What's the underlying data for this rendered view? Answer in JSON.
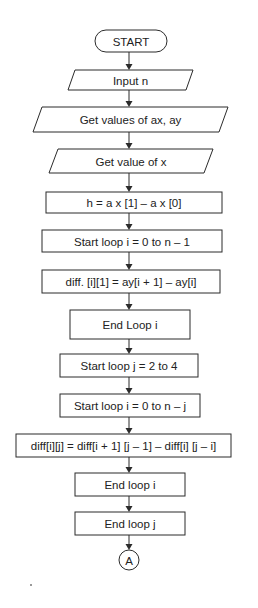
{
  "flowchart": {
    "colors": {
      "stroke": "#2b2b2b",
      "fill": "#ffffff",
      "text": "#222222"
    },
    "nodes": [
      {
        "id": "start",
        "type": "terminator",
        "label": "START",
        "x": 95,
        "y": 30,
        "w": 72,
        "h": 22
      },
      {
        "id": "input-n",
        "type": "io",
        "label": "Input n",
        "x": 68,
        "y": 70,
        "w": 125,
        "h": 20,
        "skew": 7
      },
      {
        "id": "get-ax-ay",
        "type": "io",
        "label": "Get values of ax, ay",
        "x": 33,
        "y": 107,
        "w": 195,
        "h": 25,
        "skew": 9
      },
      {
        "id": "get-x",
        "type": "io",
        "label": "Get value of x",
        "x": 49,
        "y": 149,
        "w": 164,
        "h": 24,
        "skew": 9
      },
      {
        "id": "calc-h",
        "type": "process",
        "label": "h = a x [1] – a x [0]",
        "x": 46,
        "y": 192,
        "w": 176,
        "h": 21
      },
      {
        "id": "loop-i-start-1",
        "type": "process",
        "label": "Start loop i = 0 to n – 1",
        "x": 42,
        "y": 230,
        "w": 180,
        "h": 22
      },
      {
        "id": "calc-diff-1",
        "type": "process",
        "label": "diff. [i][1] = ay[i + 1] – ay[i]",
        "x": 42,
        "y": 270,
        "w": 178,
        "h": 23
      },
      {
        "id": "loop-i-end-1",
        "type": "process",
        "label": "End Loop i",
        "x": 70,
        "y": 310,
        "w": 120,
        "h": 29
      },
      {
        "id": "loop-j-start",
        "type": "process",
        "label": "Start loop j = 2 to 4",
        "x": 60,
        "y": 354,
        "w": 138,
        "h": 23
      },
      {
        "id": "loop-i-start-2",
        "type": "process",
        "label": "Start loop i = 0 to n – j",
        "x": 60,
        "y": 394,
        "w": 140,
        "h": 23
      },
      {
        "id": "calc-diff-ij",
        "type": "process",
        "label": "diff[i][j] = diff[i + 1] [j – 1] – diff[i] [j – i]",
        "x": 16,
        "y": 434,
        "w": 215,
        "h": 23
      },
      {
        "id": "loop-i-end-2",
        "type": "process",
        "label": "End loop i",
        "x": 75,
        "y": 473,
        "w": 110,
        "h": 23
      },
      {
        "id": "loop-j-end",
        "type": "process",
        "label": "End loop j",
        "x": 75,
        "y": 512,
        "w": 110,
        "h": 23
      },
      {
        "id": "connector-a",
        "type": "connector",
        "label": "A",
        "cx": 129,
        "cy": 560,
        "r": 10
      }
    ],
    "edges": [
      {
        "from": "start",
        "to": "input-n"
      },
      {
        "from": "input-n",
        "to": "get-ax-ay"
      },
      {
        "from": "get-ax-ay",
        "to": "get-x"
      },
      {
        "from": "get-x",
        "to": "calc-h"
      },
      {
        "from": "calc-h",
        "to": "loop-i-start-1"
      },
      {
        "from": "loop-i-start-1",
        "to": "calc-diff-1"
      },
      {
        "from": "calc-diff-1",
        "to": "loop-i-end-1"
      },
      {
        "from": "loop-i-end-1",
        "to": "loop-j-start"
      },
      {
        "from": "loop-j-start",
        "to": "loop-i-start-2"
      },
      {
        "from": "loop-i-start-2",
        "to": "calc-diff-ij"
      },
      {
        "from": "calc-diff-ij",
        "to": "loop-i-end-2"
      },
      {
        "from": "loop-i-end-2",
        "to": "loop-j-end"
      },
      {
        "from": "loop-j-end",
        "to": "connector-a"
      }
    ],
    "center_x": 129
  }
}
